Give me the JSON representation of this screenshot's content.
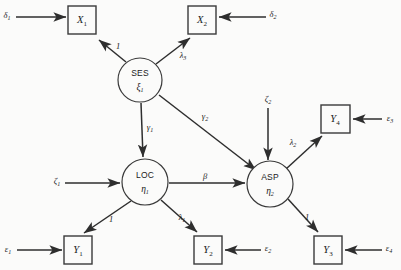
{
  "diagram": {
    "type": "structural-equation-model-path-diagram",
    "width": 401,
    "height": 270,
    "background_color": "#fbfbfa",
    "line_color": "#2e2e2e",
    "text_color": "#1a1a1a"
  },
  "observed_variables": [
    {
      "id": "x1",
      "base": "X",
      "subscript": "1",
      "label": "X₁",
      "shape": "rectangle",
      "x": 68,
      "y": 6,
      "w": 28,
      "h": 28
    },
    {
      "id": "x2",
      "base": "X",
      "subscript": "2",
      "label": "X₂",
      "shape": "rectangle",
      "x": 188,
      "y": 6,
      "w": 28,
      "h": 28
    },
    {
      "id": "y4",
      "base": "Y",
      "subscript": "4",
      "label": "Y₄",
      "shape": "rectangle",
      "x": 321,
      "y": 105,
      "w": 29,
      "h": 28
    },
    {
      "id": "y1",
      "base": "Y",
      "subscript": "1",
      "label": "Y₁",
      "shape": "rectangle",
      "x": 64,
      "y": 236,
      "w": 28,
      "h": 28
    },
    {
      "id": "y2",
      "base": "Y",
      "subscript": "2",
      "label": "Y₂",
      "shape": "rectangle",
      "x": 194,
      "y": 236,
      "w": 28,
      "h": 28
    },
    {
      "id": "y3",
      "base": "Y",
      "subscript": "3",
      "label": "Y₃",
      "shape": "rectangle",
      "x": 314,
      "y": 236,
      "w": 28,
      "h": 28
    }
  ],
  "latent_variables": [
    {
      "id": "ses",
      "name": "SES",
      "symbol_base": "ξ",
      "symbol_sub": "1",
      "symbol": "ξ₁",
      "shape": "ellipse",
      "cx": 140,
      "cy": 80,
      "rx": 22,
      "ry": 22
    },
    {
      "id": "loc",
      "name": "LOC",
      "symbol_base": "η",
      "symbol_sub": "1",
      "symbol": "η₁",
      "shape": "ellipse",
      "cx": 145,
      "cy": 182,
      "rx": 23,
      "ry": 22
    },
    {
      "id": "asp",
      "name": "ASP",
      "symbol_base": "η",
      "symbol_sub": "2",
      "symbol": "η₂",
      "shape": "ellipse",
      "cx": 270,
      "cy": 184,
      "rx": 23,
      "ry": 22
    }
  ],
  "error_terms": [
    {
      "id": "delta1",
      "base": "δ",
      "subscript": "1",
      "label": "δ₁",
      "x": 7,
      "y": 16,
      "target": "x1"
    },
    {
      "id": "delta2",
      "base": "δ",
      "subscript": "2",
      "label": "δ₂",
      "x": 273,
      "y": 15,
      "target": "x2"
    },
    {
      "id": "epsilon3",
      "base": "ε",
      "subscript": "3",
      "label": "ε₃",
      "x": 390,
      "y": 119,
      "target": "y4"
    },
    {
      "id": "epsilon1",
      "base": "ε",
      "subscript": "1",
      "label": "ε₁",
      "x": 8,
      "y": 250,
      "target": "y1"
    },
    {
      "id": "epsilon2",
      "base": "ε",
      "subscript": "2",
      "label": "ε₂",
      "x": 268,
      "y": 249,
      "target": "y2"
    },
    {
      "id": "epsilon4",
      "base": "ε",
      "subscript": "4",
      "label": "ε₄",
      "x": 389,
      "y": 249,
      "target": "y3"
    }
  ],
  "disturbance_terms": [
    {
      "id": "zeta1",
      "base": "ζ",
      "subscript": "1",
      "label": "ζ₁",
      "x": 57,
      "y": 182,
      "target": "loc"
    },
    {
      "id": "zeta2",
      "base": "ζ",
      "subscript": "2",
      "label": "ζ₂",
      "x": 268,
      "y": 100,
      "target": "asp"
    }
  ],
  "paths": [
    {
      "id": "ses-x1",
      "from": "ses",
      "to": "x1",
      "coefficient": "1",
      "coef_base": "1",
      "coef_sub": "",
      "label_x": 118,
      "label_y": 47
    },
    {
      "id": "ses-x2",
      "from": "ses",
      "to": "x2",
      "coefficient": "λ₃",
      "coef_base": "λ",
      "coef_sub": "3",
      "label_x": 183,
      "label_y": 56
    },
    {
      "id": "ses-loc",
      "from": "ses",
      "to": "loc",
      "coefficient": "γ₁",
      "coef_base": "γ",
      "coef_sub": "1",
      "label_x": 148,
      "label_y": 128
    },
    {
      "id": "ses-asp",
      "from": "ses",
      "to": "asp",
      "coefficient": "γ₂",
      "coef_base": "γ",
      "coef_sub": "2",
      "label_x": 205,
      "label_y": 117
    },
    {
      "id": "loc-asp",
      "from": "loc",
      "to": "asp",
      "coefficient": "β",
      "coef_base": "β",
      "coef_sub": "",
      "label_x": 205,
      "label_y": 177
    },
    {
      "id": "loc-y1",
      "from": "loc",
      "to": "y1",
      "coefficient": "1",
      "coef_base": "1",
      "coef_sub": "",
      "label_x": 111,
      "label_y": 220
    },
    {
      "id": "loc-y2",
      "from": "loc",
      "to": "y2",
      "coefficient": "λ₁",
      "coef_base": "λ",
      "coef_sub": "1",
      "label_x": 182,
      "label_y": 218
    },
    {
      "id": "asp-y4",
      "from": "asp",
      "to": "y4",
      "coefficient": "λ₂",
      "coef_base": "λ",
      "coef_sub": "2",
      "label_x": 293,
      "label_y": 143
    },
    {
      "id": "asp-y3",
      "from": "asp",
      "to": "y3",
      "coefficient": "1",
      "coef_base": "1",
      "coef_sub": "",
      "label_x": 307,
      "label_y": 218
    }
  ]
}
